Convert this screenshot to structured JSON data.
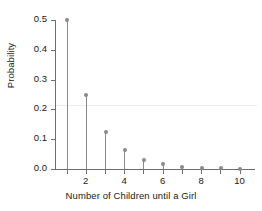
{
  "chart_data": {
    "type": "scatter",
    "plot_style": "stem",
    "title": "",
    "subtitle": "",
    "xlabel": "Number of Children until a Girl",
    "ylabel": "Probability",
    "x": [
      1,
      2,
      3,
      4,
      5,
      6,
      7,
      8,
      9,
      10
    ],
    "values": [
      0.5,
      0.25,
      0.125,
      0.0625,
      0.03125,
      0.0156,
      0.0078,
      0.0039,
      0.002,
      0.001
    ],
    "series": [
      {
        "name": "Probability",
        "values": [
          0.5,
          0.25,
          0.125,
          0.0625,
          0.03125,
          0.0156,
          0.0078,
          0.0039,
          0.002,
          0.001
        ]
      }
    ],
    "xlim": [
      0.4,
      10.8
    ],
    "ylim": [
      0.0,
      0.52
    ],
    "x_ticks": [
      1,
      2,
      3,
      4,
      5,
      6,
      7,
      8,
      9,
      10
    ],
    "x_tick_labels": [
      "",
      "2",
      "",
      "4",
      "",
      "6",
      "",
      "8",
      "",
      "10"
    ],
    "y_ticks": [
      0.0,
      0.1,
      0.2,
      0.3,
      0.4,
      0.5
    ],
    "y_tick_labels": [
      "0.0",
      "0.1",
      "0.2",
      "0.3",
      "0.4",
      "0.5"
    ],
    "grid": false,
    "legend": false,
    "legend_position": "none",
    "annotations": [],
    "colors": {
      "marker": "#8a8a8a",
      "stem": "#8a8a8a",
      "axis": "#6e6e6e",
      "text": "#1a1a1a",
      "background": "#ffffff",
      "faint_rule": "#ededed"
    },
    "faint_rule_value": 0.22
  }
}
